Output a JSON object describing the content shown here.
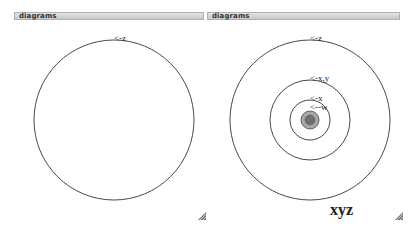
{
  "panels": [
    {
      "title": "diagrams",
      "labels": {
        "z": "<-z"
      }
    },
    {
      "title": "diagrams",
      "labels": {
        "z": "<-z",
        "xy": "<-x,y",
        "x": "<-x",
        "w": "<--w"
      },
      "caption": "xyz"
    }
  ],
  "colors": {
    "stroke": "#333333",
    "disc_outer": "#a8a8a8",
    "disc_inner": "#707070",
    "titlebar": "#d0d0d0"
  }
}
